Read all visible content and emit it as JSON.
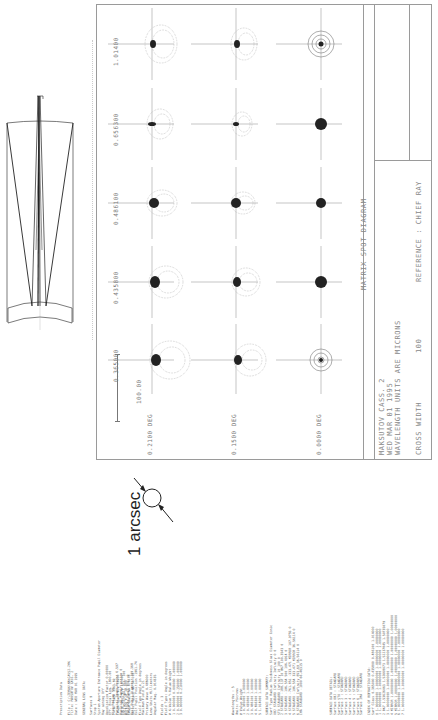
{
  "page": {
    "orientation": "rotated-90-ccw",
    "background": "#ffffff"
  },
  "spot_diagram": {
    "title": "MATRIX SPOT DIAGRAM",
    "system_name": "MAKSUTOV CASS. 2",
    "date": "WED MAR 01 1995",
    "units_note": "WAVELENGTH UNITS ARE MICRONS",
    "reference": "REFERENCE : CHIEF RAY",
    "box_width_label": "CROSS WIDTH",
    "box_width_value": "100",
    "scale_bar_label": "100.00",
    "wavelengths": [
      "1.01400",
      "0.656300",
      "0.486100",
      "0.435800",
      "0.365000"
    ],
    "fields": [
      "0.2100 DEG",
      "0.1500 DEG",
      "0.0000 DEG"
    ]
  },
  "annotation": {
    "arcsec_label": "1 arcsec"
  },
  "layout_drawing": {
    "name": "maksutov-cassegrain-layout"
  },
  "prescription": {
    "heading": "Prescription Data",
    "file_line": "File : C:\\ZEMAX\\MAKCASS2.ZMX",
    "title_line": "Title: MAKSUTOV CASS. 2",
    "date_line": "Date : WED MAR 01 1995",
    "general_heading": "GENERAL LENS DATA:",
    "general_rows": [
      [
        "Surfaces",
        "9"
      ],
      [
        "Stop",
        "1"
      ],
      [
        "System Aperture",
        "Entrance Pupil Diameter"
      ],
      [
        "Ray aiming",
        "Off"
      ],
      [
        "Apodization Factor",
        "0.00000"
      ],
      [
        "Eff. Focal Len.",
        "1800.00"
      ],
      [
        "Total Track",
        "1363.69"
      ],
      [
        "Image Space F/#",
        "18.00"
      ],
      [
        "Para. Wkg. F/#",
        "18.000"
      ],
      [
        "Working F/#",
        "18.000"
      ],
      [
        "Image Space NA",
        "0.0278"
      ],
      [
        "Object Space NA",
        "5e-010"
      ],
      [
        "Stop Radius",
        "50"
      ],
      [
        "Paraxial Image Height",
        "6.597"
      ],
      [
        "Paraxial Magnification",
        "0"
      ],
      [
        "Entrance Pupil Dia.",
        "100"
      ],
      [
        "Entrance Pupil Pos.",
        "0"
      ],
      [
        "Exit Pupil Diameter",
        "109.368"
      ],
      [
        "Exit Pupil Position",
        "-1961.74"
      ],
      [
        "Field Type",
        "Angle in degrees"
      ],
      [
        "Maximum Field",
        "0.21"
      ],
      [
        "Primary Wave",
        "0.486000"
      ],
      [
        "Lens Units",
        "Millimeters"
      ],
      [
        "Angular Mag.",
        "0.914335"
      ]
    ],
    "fields_heading": "Fields : 3",
    "field_type": "Field Type: Angle in degrees",
    "field_columns": [
      "#",
      "X-Value",
      "Y-Value",
      "Weight"
    ],
    "field_rows": [
      [
        "1",
        "0.000000",
        "0.000000",
        "1.000000"
      ],
      [
        "2",
        "0.000000",
        "0.150000",
        "1.000000"
      ],
      [
        "3",
        "0.000000",
        "0.210000",
        "1.000000"
      ]
    ],
    "wavelengths_heading": "Wavelengths : 5",
    "wavelength_units": "Units: Microns",
    "wavelength_columns": [
      "#",
      "Value",
      "Weight"
    ],
    "wavelength_rows": [
      [
        "1",
        "0.365000",
        "1.000000"
      ],
      [
        "2",
        "0.435800",
        "1.000000"
      ],
      [
        "3",
        "0.486100",
        "1.000000"
      ],
      [
        "4",
        "0.656300",
        "1.000000"
      ],
      [
        "5",
        "1.014000",
        "1.000000"
      ]
    ],
    "surface_summary_heading": "SURFACE DATA SUMMARY:",
    "surface_columns": [
      "Surf",
      "Type",
      "Radius",
      "Thickness",
      "Glass",
      "Diameter",
      "Conic"
    ],
    "surface_rows": [
      [
        "OBJ",
        "STANDARD",
        "Infinity",
        "Infinity",
        "",
        "0",
        "0"
      ],
      [
        "STO",
        "STANDARD",
        "Infinity",
        "10",
        "",
        "100",
        "0"
      ],
      [
        "2",
        "STANDARD",
        "-188.137",
        "10",
        "BK7",
        "100.3543",
        "0"
      ],
      [
        "3",
        "STANDARD",
        "-196.554",
        "500",
        "",
        "106.4914",
        "0"
      ],
      [
        "4",
        "STANDARD",
        "-761.851",
        "-333.471",
        "MIRROR",
        "107.9755",
        "0"
      ],
      [
        "5",
        "STANDARD",
        "-196.554",
        "333.471",
        "MIRROR",
        "36.56114",
        "0"
      ],
      [
        "6",
        "STANDARD",
        "Infinity",
        "853.69",
        "",
        "36.56114",
        "0"
      ],
      [
        "IMA",
        "STANDARD",
        "-1000",
        "",
        "",
        "66.46315",
        "0"
      ]
    ],
    "surface_detail_heading": "SURFACE DATA DETAIL:",
    "surface_detail_rows": [
      [
        "Surface OBJ",
        "STANDARD"
      ],
      [
        "Surface STO",
        "STANDARD"
      ],
      [
        "Surface 2",
        "STANDARD"
      ],
      [
        "Surface 3",
        "STANDARD"
      ],
      [
        "Surface 4",
        "STANDARD"
      ],
      [
        "Surface 5",
        "STANDARD"
      ],
      [
        "Surface 6",
        "STANDARD"
      ],
      [
        "Surface IMA",
        "STANDARD"
      ]
    ],
    "index_heading": "INDEX OF REFRACTION DATA:",
    "index_columns": [
      "Surf",
      "Glass",
      "0.365000",
      "0.435800",
      "0.486100",
      "1.014000"
    ],
    "index_rows": [
      [
        "0",
        "",
        "1.00000000",
        "1.00000000",
        "1.00000000",
        "1.00000000"
      ],
      [
        "1",
        "",
        "1.00000000",
        "1.00000000",
        "1.00000000",
        "1.00000000"
      ],
      [
        "2",
        "BK7",
        "1.53626063",
        "1.52668073",
        "1.52237845",
        "1.50735079"
      ],
      [
        "3",
        "",
        "1.00000000",
        "1.00000000",
        "1.00000000",
        "1.00000000"
      ],
      [
        "4",
        "MIRROR",
        "1.00000000",
        "1.00000000",
        "1.00000000",
        "1.00000000"
      ],
      [
        "5",
        "MIRROR",
        "1.00000000",
        "1.00000000",
        "1.00000000",
        "1.00000000"
      ],
      [
        "6",
        "",
        "1.00000000",
        "1.00000000",
        "1.00000000",
        "1.00000000"
      ],
      [
        "7",
        "",
        "1.00000000",
        "1.00000000",
        "1.00000000",
        "1.00000000"
      ]
    ]
  }
}
